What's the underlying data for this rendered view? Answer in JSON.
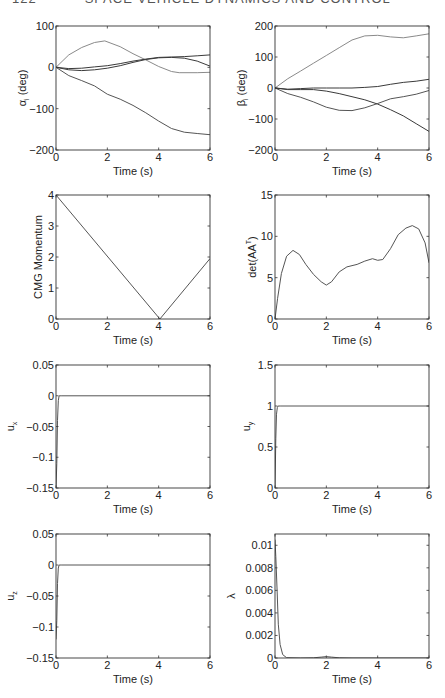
{
  "page": {
    "number": "122",
    "running_head": "SPACE VEHICLE DYNAMICS AND CONTROL"
  },
  "style": {
    "axis_color": "#333333",
    "line_dark": "#3a3a3a",
    "line_light": "#8a8a8a",
    "line_mid": "#555555"
  },
  "chart_data": [
    {
      "id": "alpha",
      "type": "line",
      "title": "",
      "xlabel": "Time (s)",
      "ylabel": "αi (deg)",
      "ylabel_main": "α",
      "ylabel_sub": "i",
      "ylabel_tail": " (deg)",
      "xlim": [
        0,
        6
      ],
      "ylim": [
        -200,
        100
      ],
      "xticks": [
        0,
        2,
        4,
        6
      ],
      "yticks": [
        -200,
        -100,
        0,
        100
      ],
      "ytick_labels": [
        "−200",
        "−100",
        "0",
        "100"
      ],
      "grid": false,
      "series": [
        {
          "name": "alpha_1",
          "shade": "light",
          "x": [
            0,
            0.5,
            1,
            1.5,
            1.9,
            2.5,
            3,
            3.5,
            4,
            4.5,
            4.8,
            5.5,
            6
          ],
          "y": [
            0,
            30,
            48,
            60,
            64,
            50,
            33,
            18,
            2,
            -10,
            -13,
            -13,
            -12
          ]
        },
        {
          "name": "alpha_2",
          "shade": "dark",
          "x": [
            0,
            0.5,
            1,
            1.5,
            2,
            2.5,
            3,
            3.5,
            4,
            4.5,
            5,
            5.5,
            6
          ],
          "y": [
            0,
            -3,
            -2,
            1,
            4,
            9,
            15,
            20,
            24,
            25,
            26,
            28,
            30
          ]
        },
        {
          "name": "alpha_3",
          "shade": "dark",
          "x": [
            0,
            0.5,
            1,
            1.5,
            2,
            2.5,
            3,
            3.5,
            4,
            4.5,
            5,
            5.5,
            6
          ],
          "y": [
            0,
            -6,
            -8,
            -6,
            -2,
            4,
            12,
            19,
            23,
            24,
            22,
            15,
            3
          ]
        },
        {
          "name": "alpha_4",
          "shade": "mid",
          "x": [
            0,
            0.5,
            1,
            1.5,
            2,
            2.5,
            3,
            3.5,
            4,
            4.5,
            5,
            5.5,
            6
          ],
          "y": [
            0,
            -20,
            -32,
            -45,
            -65,
            -77,
            -92,
            -110,
            -130,
            -148,
            -157,
            -160,
            -163
          ]
        }
      ]
    },
    {
      "id": "beta",
      "type": "line",
      "title": "",
      "xlabel": "Time (s)",
      "ylabel": "βi (deg)",
      "ylabel_main": "β",
      "ylabel_sub": "i",
      "ylabel_tail": " (deg)",
      "xlim": [
        0,
        6
      ],
      "ylim": [
        -200,
        200
      ],
      "xticks": [
        0,
        2,
        4,
        6
      ],
      "yticks": [
        -200,
        -100,
        0,
        100,
        200
      ],
      "ytick_labels": [
        "−200",
        "−100",
        "0",
        "100",
        "200"
      ],
      "grid": false,
      "series": [
        {
          "name": "beta_1",
          "shade": "light",
          "x": [
            0,
            0.5,
            1,
            1.5,
            2,
            2.5,
            3,
            3.5,
            4,
            4.5,
            5,
            5.5,
            6
          ],
          "y": [
            0,
            30,
            55,
            80,
            105,
            130,
            155,
            168,
            170,
            165,
            162,
            168,
            175
          ]
        },
        {
          "name": "beta_2",
          "shade": "dark",
          "x": [
            0,
            0.5,
            1,
            1.5,
            2,
            2.5,
            3,
            3.5,
            4,
            4.5,
            5,
            5.5,
            6
          ],
          "y": [
            0,
            -4,
            -2,
            0,
            0,
            0,
            0,
            2,
            5,
            12,
            18,
            22,
            28
          ]
        },
        {
          "name": "beta_3",
          "shade": "mid",
          "x": [
            0,
            0.5,
            1,
            1.5,
            2,
            2.5,
            3,
            3.5,
            4,
            4.5,
            5,
            5.5,
            6
          ],
          "y": [
            0,
            -18,
            -30,
            -45,
            -62,
            -72,
            -73,
            -64,
            -50,
            -35,
            -28,
            -20,
            -8
          ]
        },
        {
          "name": "beta_4",
          "shade": "dark",
          "x": [
            0,
            0.5,
            1,
            1.5,
            2,
            2.5,
            3,
            3.5,
            4,
            4.5,
            5,
            5.5,
            6
          ],
          "y": [
            0,
            -5,
            -5,
            -5,
            -10,
            -18,
            -28,
            -38,
            -52,
            -70,
            -90,
            -115,
            -140
          ]
        }
      ]
    },
    {
      "id": "cmg_momentum",
      "type": "line",
      "title": "",
      "xlabel": "Time (s)",
      "ylabel": "CMG Momentum",
      "ylabel_main": "CMG Momentum",
      "ylabel_sub": "",
      "ylabel_tail": "",
      "xlim": [
        0,
        6
      ],
      "ylim": [
        0,
        4
      ],
      "xticks": [
        0,
        2,
        4,
        6
      ],
      "yticks": [
        0,
        1,
        2,
        3,
        4
      ],
      "ytick_labels": [
        "0",
        "1",
        "2",
        "3",
        "4"
      ],
      "grid": false,
      "series": [
        {
          "name": "momentum",
          "shade": "mid",
          "x": [
            0,
            4.05,
            6
          ],
          "y": [
            4,
            0,
            1.95
          ]
        }
      ]
    },
    {
      "id": "det_aat",
      "type": "line",
      "title": "",
      "xlabel": "Time (s)",
      "ylabel": "det(AAT)",
      "ylabel_main": "det(AA",
      "ylabel_sup": "T",
      "ylabel_tail": ")",
      "xlim": [
        0,
        6
      ],
      "ylim": [
        0,
        15
      ],
      "xticks": [
        0,
        2,
        4,
        6
      ],
      "yticks": [
        0,
        5,
        10,
        15
      ],
      "ytick_labels": [
        "0",
        "5",
        "10",
        "15"
      ],
      "grid": false,
      "series": [
        {
          "name": "det",
          "shade": "mid",
          "x": [
            0,
            0.1,
            0.25,
            0.45,
            0.7,
            0.95,
            1.2,
            1.5,
            1.8,
            2.0,
            2.2,
            2.5,
            2.8,
            3.2,
            3.5,
            3.8,
            4.0,
            4.2,
            4.5,
            4.8,
            5.1,
            5.35,
            5.6,
            5.85,
            6.0
          ],
          "y": [
            0,
            2.5,
            5.5,
            7.6,
            8.3,
            7.8,
            6.6,
            5.4,
            4.5,
            4.1,
            4.5,
            5.7,
            6.3,
            6.6,
            7.0,
            7.3,
            7.1,
            7.2,
            8.5,
            10.2,
            11.0,
            11.3,
            10.9,
            9.2,
            6.8
          ]
        }
      ]
    },
    {
      "id": "u_x",
      "type": "line",
      "title": "",
      "xlabel": "Time (s)",
      "ylabel": "ux",
      "ylabel_main": "u",
      "ylabel_sub": "x",
      "ylabel_tail": "",
      "xlim": [
        0,
        6
      ],
      "ylim": [
        -0.15,
        0.05
      ],
      "xticks": [
        0,
        2,
        4,
        6
      ],
      "yticks": [
        -0.15,
        -0.1,
        -0.05,
        0,
        0.05
      ],
      "ytick_labels": [
        "−0.15",
        "−0.1",
        "−0.05",
        "0",
        "0.05"
      ],
      "grid": false,
      "series": [
        {
          "name": "ux",
          "shade": "mid",
          "x": [
            0,
            0.03,
            0.06,
            0.09,
            0.12,
            0.2,
            6
          ],
          "y": [
            -0.15,
            -0.11,
            -0.04,
            -0.008,
            0,
            0,
            0
          ]
        }
      ]
    },
    {
      "id": "u_y",
      "type": "line",
      "title": "",
      "xlabel": "Time (s)",
      "ylabel": "uy",
      "ylabel_main": "u",
      "ylabel_sub": "y",
      "ylabel_tail": "",
      "xlim": [
        0,
        6
      ],
      "ylim": [
        0,
        1.5
      ],
      "xticks": [
        0,
        2,
        4,
        6
      ],
      "yticks": [
        0,
        0.5,
        1,
        1.5
      ],
      "ytick_labels": [
        "0",
        "0.5",
        "1",
        "1.5"
      ],
      "grid": false,
      "series": [
        {
          "name": "uy",
          "shade": "mid",
          "x": [
            0,
            0.03,
            0.06,
            0.09,
            0.12,
            0.2,
            6
          ],
          "y": [
            0,
            0.6,
            0.9,
            0.98,
            1.0,
            1.0,
            1.0
          ]
        }
      ]
    },
    {
      "id": "u_z",
      "type": "line",
      "title": "",
      "xlabel": "Time (s)",
      "ylabel": "uz",
      "ylabel_main": "u",
      "ylabel_sub": "z",
      "ylabel_tail": "",
      "xlim": [
        0,
        6
      ],
      "ylim": [
        -0.15,
        0.05
      ],
      "xticks": [
        0,
        2,
        4,
        6
      ],
      "yticks": [
        -0.15,
        -0.1,
        -0.05,
        0,
        0.05
      ],
      "ytick_labels": [
        "−0.15",
        "−0.1",
        "−0.05",
        "0",
        "0.05"
      ],
      "grid": false,
      "series": [
        {
          "name": "uz",
          "shade": "mid",
          "x": [
            0,
            0.03,
            0.06,
            0.09,
            0.12,
            0.2,
            6
          ],
          "y": [
            -0.12,
            -0.09,
            -0.03,
            -0.005,
            0,
            0,
            0
          ]
        }
      ]
    },
    {
      "id": "lambda",
      "type": "line",
      "title": "",
      "xlabel": "Time (s)",
      "ylabel": "λ",
      "ylabel_main": "λ",
      "ylabel_sub": "",
      "ylabel_tail": "",
      "xlim": [
        0,
        6
      ],
      "ylim": [
        0,
        0.011
      ],
      "xticks": [
        0,
        2,
        4,
        6
      ],
      "yticks": [
        0,
        0.002,
        0.004,
        0.006,
        0.008,
        0.01
      ],
      "ytick_labels": [
        "0",
        "0.002",
        "0.004",
        "0.006",
        "0.008",
        "0.01"
      ],
      "grid": false,
      "series": [
        {
          "name": "lambda",
          "shade": "mid",
          "x": [
            0,
            0.03,
            0.08,
            0.13,
            0.2,
            0.3,
            0.45,
            1.0,
            1.5,
            1.8,
            2.0,
            2.2,
            2.5,
            3.0,
            6.0
          ],
          "y": [
            0.0105,
            0.009,
            0.006,
            0.003,
            0.0012,
            0.0003,
            3e-05,
            0,
            2e-05,
            8e-05,
            0.00012,
            8e-05,
            2e-05,
            0,
            0
          ]
        }
      ]
    }
  ],
  "layout": {
    "panels": [
      {
        "chart": 0,
        "x": 56,
        "y": 26,
        "w": 154,
        "h": 124
      },
      {
        "chart": 1,
        "x": 275,
        "y": 26,
        "w": 154,
        "h": 124
      },
      {
        "chart": 2,
        "x": 56,
        "y": 195,
        "w": 154,
        "h": 124
      },
      {
        "chart": 3,
        "x": 275,
        "y": 195,
        "w": 154,
        "h": 124
      },
      {
        "chart": 4,
        "x": 56,
        "y": 365,
        "w": 154,
        "h": 123
      },
      {
        "chart": 5,
        "x": 275,
        "y": 365,
        "w": 154,
        "h": 123
      },
      {
        "chart": 6,
        "x": 56,
        "y": 534,
        "w": 154,
        "h": 124
      },
      {
        "chart": 7,
        "x": 275,
        "y": 534,
        "w": 154,
        "h": 124
      }
    ]
  }
}
